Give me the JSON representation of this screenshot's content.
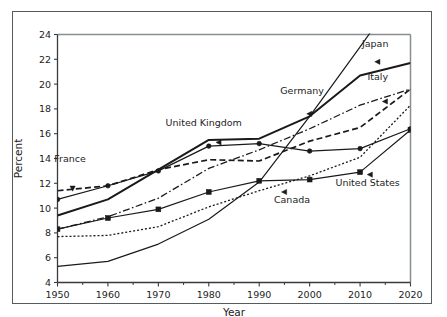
{
  "chart_data": {
    "type": "line",
    "title": "",
    "xlabel": "Year",
    "ylabel": "Percent",
    "xlim": [
      1950,
      2020
    ],
    "ylim": [
      4,
      24
    ],
    "xticks": [
      1950,
      1960,
      1970,
      1980,
      1990,
      2000,
      2010,
      2020
    ],
    "xticklabels": [
      "1950",
      "1960",
      "1970",
      "1980",
      "1990",
      "2000",
      "2010",
      "2020"
    ],
    "xminorticks": [
      1955,
      1965,
      1975,
      1985,
      1995,
      2005,
      2015
    ],
    "yticks": [
      4,
      6,
      8,
      10,
      12,
      14,
      16,
      18,
      20,
      22,
      24
    ],
    "yticklabels": [
      "4",
      "6",
      "8",
      "10",
      "12",
      "14",
      "16",
      "18",
      "20",
      "22",
      "24"
    ],
    "grid": false,
    "legend": "inline-annotations",
    "series": [
      {
        "name": "France",
        "label": "France",
        "style": "dashed",
        "marker": "triangle-down",
        "x": [
          1950,
          1960,
          1970,
          1980,
          1990,
          2000,
          2010,
          2020
        ],
        "values": [
          11.4,
          11.8,
          13.1,
          13.9,
          13.8,
          15.4,
          16.5,
          19.6
        ]
      },
      {
        "name": "United Kingdom",
        "label": "United Kingdom",
        "style": "solid-thin",
        "marker": "circle",
        "x": [
          1950,
          1960,
          1970,
          1980,
          1990,
          2000,
          2010,
          2020
        ],
        "values": [
          10.7,
          11.8,
          13.0,
          15.0,
          15.2,
          14.6,
          14.8,
          16.4
        ]
      },
      {
        "name": "Germany",
        "label": "Germany",
        "style": "solid-thick",
        "marker": "triangle-left",
        "x": [
          1950,
          1960,
          1970,
          1980,
          1990,
          2000,
          2010,
          2020
        ],
        "values": [
          9.4,
          10.7,
          13.1,
          15.5,
          15.6,
          17.4,
          20.7,
          21.7
        ]
      },
      {
        "name": "United States",
        "label": "United States",
        "style": "solid-thin",
        "marker": "square",
        "x": [
          1950,
          1960,
          1970,
          1980,
          1990,
          2000,
          2010,
          2020
        ],
        "values": [
          8.3,
          9.2,
          9.9,
          11.3,
          12.2,
          12.3,
          12.9,
          16.3
        ]
      },
      {
        "name": "Italy",
        "label": "Italy",
        "style": "dash-dot",
        "marker": "triangle-left",
        "x": [
          1950,
          1960,
          1970,
          1980,
          1990,
          2000,
          2010,
          2020
        ],
        "values": [
          8.3,
          9.3,
          10.8,
          13.2,
          14.7,
          16.4,
          18.3,
          19.6
        ]
      },
      {
        "name": "Canada",
        "label": "Canada",
        "style": "dotted",
        "marker": "triangle-left",
        "x": [
          1950,
          1960,
          1970,
          1980,
          1990,
          2000,
          2010,
          2020
        ],
        "values": [
          7.7,
          7.8,
          8.5,
          10.1,
          11.4,
          12.6,
          14.1,
          18.3
        ]
      },
      {
        "name": "Japan",
        "label": "Japan",
        "style": "solid-thin",
        "marker": "triangle-left",
        "x": [
          1950,
          1960,
          1970,
          1980,
          1990,
          2000,
          2010,
          2020
        ],
        "values": [
          5.3,
          5.7,
          7.1,
          9.1,
          12.1,
          17.4,
          23.0,
          28.7
        ]
      }
    ],
    "annotations": [
      {
        "text": "France",
        "x": 1952.5,
        "y": 13.7
      },
      {
        "text": "United Kingdom",
        "x": 1979.0,
        "y": 16.6
      },
      {
        "text": "Germany",
        "x": 1998.5,
        "y": 19.2
      },
      {
        "text": "Japan",
        "x": 2013.0,
        "y": 23.0
      },
      {
        "text": "Italy",
        "x": 2013.5,
        "y": 20.3
      },
      {
        "text": "Canada",
        "x": 1996.5,
        "y": 10.4
      },
      {
        "text": "United States",
        "x": 2011.5,
        "y": 11.8
      }
    ],
    "colors": {
      "line": "#1a1a1a",
      "frame": "#555b5e",
      "axis": "#888d90",
      "text": "#1d1d1d",
      "background": "#ffffff"
    }
  }
}
